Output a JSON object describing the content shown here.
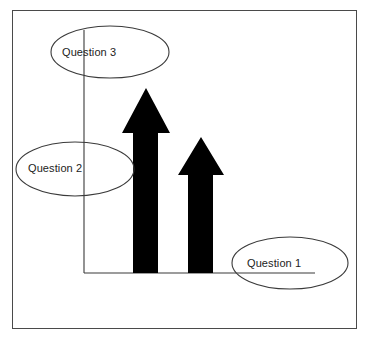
{
  "diagram": {
    "background_color": "#ffffff",
    "frame": {
      "name": "outer-border",
      "stroke_color": "#4a4a4a",
      "x": 12,
      "y": 10,
      "width": 345,
      "height": 319
    },
    "axes": {
      "stroke_color": "#3a3a3a",
      "y_axis": {
        "x": 84,
        "y_top": 30,
        "y_bottom": 273
      },
      "x_axis": {
        "y": 273,
        "x_left": 84,
        "x_right": 315
      }
    },
    "arrows": [
      {
        "id": "arrow-tall",
        "label": "tall-up-arrow",
        "fill_color": "#000000",
        "tip_y": 88,
        "head_base_y": 133,
        "base_y": 273,
        "shaft_left": 133,
        "shaft_right": 158,
        "head_left": 122,
        "head_right": 170,
        "height_px": 185
      },
      {
        "id": "arrow-short",
        "label": "short-up-arrow",
        "fill_color": "#000000",
        "tip_y": 137,
        "head_base_y": 175,
        "base_y": 273,
        "shaft_left": 188,
        "shaft_right": 213,
        "head_left": 178,
        "head_right": 224,
        "height_px": 136
      }
    ],
    "callouts": [
      {
        "id": "question-3",
        "label": "Question 3",
        "ellipse": {
          "cx": 110,
          "cy": 52,
          "rx": 59,
          "ry": 26
        },
        "text_x": 62,
        "text_y": 46,
        "stroke_color": "#3a3a3a"
      },
      {
        "id": "question-2",
        "label": "Question 2",
        "ellipse": {
          "cx": 75,
          "cy": 169,
          "rx": 59,
          "ry": 27
        },
        "text_x": 28,
        "text_y": 162,
        "stroke_color": "#3a3a3a"
      },
      {
        "id": "question-1",
        "label": "Question 1",
        "ellipse": {
          "cx": 290,
          "cy": 263,
          "rx": 58,
          "ry": 26
        },
        "text_x": 247,
        "text_y": 257,
        "stroke_color": "#3a3a3a"
      }
    ]
  }
}
